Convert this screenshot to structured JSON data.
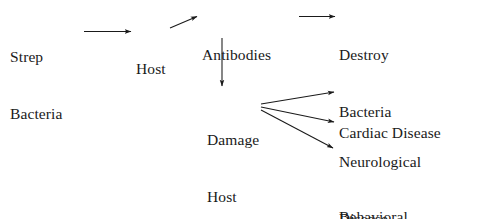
{
  "diagram": {
    "type": "flow-diagram",
    "stroke_color": "#1a1a1a",
    "background_color": "#ffffff",
    "nodes": [
      {
        "id": "strep-bacteria",
        "lines": [
          "Strep",
          "Bacteria"
        ]
      },
      {
        "id": "host",
        "lines": [
          "Host"
        ]
      },
      {
        "id": "antibodies",
        "lines": [
          "Antibodies"
        ]
      },
      {
        "id": "destroy-bacteria",
        "lines": [
          "Destroy",
          "Bacteria"
        ]
      },
      {
        "id": "damage-host",
        "lines": [
          "Damage",
          "Host"
        ]
      },
      {
        "id": "cardiac-disease",
        "lines": [
          "Cardiac Disease"
        ]
      },
      {
        "id": "neurological-disease",
        "lines": [
          "Neurological",
          "Disease"
        ]
      },
      {
        "id": "behavioral-disorders",
        "lines": [
          "Behavioral",
          "Disorders"
        ]
      }
    ],
    "edges": [
      {
        "id": "strep-to-host",
        "from": "strep-bacteria",
        "to": "host"
      },
      {
        "id": "host-to-antibodies",
        "from": "host",
        "to": "antibodies"
      },
      {
        "id": "antibodies-to-destroy",
        "from": "antibodies",
        "to": "destroy-bacteria"
      },
      {
        "id": "antibodies-to-damage",
        "from": "antibodies",
        "to": "damage-host"
      },
      {
        "id": "damage-to-cardiac",
        "from": "damage-host",
        "to": "cardiac-disease"
      },
      {
        "id": "damage-to-neurological",
        "from": "damage-host",
        "to": "neurological-disease"
      },
      {
        "id": "damage-to-behavioral",
        "from": "damage-host",
        "to": "behavioral-disorders"
      }
    ]
  }
}
